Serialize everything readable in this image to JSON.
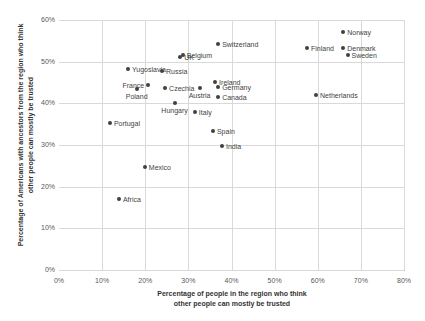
{
  "chart_data": {
    "type": "scatter",
    "title": "",
    "xlabel_line1": "Percentage of people in the region who think",
    "xlabel_line2": "other people can mostly be trusted",
    "ylabel_line1": "Percentage of Americans with ancestors from the region who think",
    "ylabel_line2": "other people can mostly be trusted",
    "xlim": [
      0,
      80
    ],
    "ylim": [
      0,
      60
    ],
    "x_ticks": [
      "0%",
      "10%",
      "20%",
      "30%",
      "40%",
      "50%",
      "60%",
      "70%",
      "80%"
    ],
    "x_tick_values": [
      0,
      10,
      20,
      30,
      40,
      50,
      60,
      70,
      80
    ],
    "y_ticks": [
      "0%",
      "10%",
      "20%",
      "30%",
      "40%",
      "50%",
      "60%"
    ],
    "y_tick_values": [
      0,
      10,
      20,
      30,
      40,
      50,
      60
    ],
    "grid": true,
    "legend": "none",
    "marker_color": "#404040",
    "grid_color": "#d9d9d9",
    "points": [
      {
        "label": "Norway",
        "x": 65.9,
        "y": 57.1,
        "pos": "right"
      },
      {
        "label": "Finland",
        "x": 57.5,
        "y": 53.2,
        "pos": "right"
      },
      {
        "label": "Denmark",
        "x": 65.9,
        "y": 53.2,
        "pos": "right"
      },
      {
        "label": "Sweden",
        "x": 66.9,
        "y": 51.6,
        "pos": "right"
      },
      {
        "label": "Switzerland",
        "x": 36.9,
        "y": 54.2,
        "pos": "right"
      },
      {
        "label": "Belgium",
        "x": 28.7,
        "y": 51.6,
        "pos": "right"
      },
      {
        "label": "UK",
        "x": 28.1,
        "y": 51.1,
        "pos": "right"
      },
      {
        "label": "Yugoslavia",
        "x": 16.0,
        "y": 48.2,
        "pos": "right"
      },
      {
        "label": "Russia",
        "x": 23.9,
        "y": 47.8,
        "pos": "right"
      },
      {
        "label": "France",
        "x": 20.7,
        "y": 44.4,
        "pos": "left"
      },
      {
        "label": "Poland",
        "x": 18.0,
        "y": 43.4,
        "pos": "below"
      },
      {
        "label": "Czechia",
        "x": 24.6,
        "y": 43.7,
        "pos": "right"
      },
      {
        "label": "Austria",
        "x": 32.6,
        "y": 43.7,
        "pos": "below"
      },
      {
        "label": "Ireland",
        "x": 36.2,
        "y": 45.1,
        "pos": "right"
      },
      {
        "label": "Germany",
        "x": 36.9,
        "y": 43.9,
        "pos": "right"
      },
      {
        "label": "Canada",
        "x": 36.9,
        "y": 41.5,
        "pos": "right"
      },
      {
        "label": "Netherlands",
        "x": 59.6,
        "y": 42.0,
        "pos": "right"
      },
      {
        "label": "Hungary",
        "x": 26.8,
        "y": 40.1,
        "pos": "below"
      },
      {
        "label": "Italy",
        "x": 31.5,
        "y": 37.9,
        "pos": "right"
      },
      {
        "label": "Portugal",
        "x": 11.8,
        "y": 35.3,
        "pos": "right"
      },
      {
        "label": "Spain",
        "x": 35.7,
        "y": 33.4,
        "pos": "right"
      },
      {
        "label": "India",
        "x": 37.8,
        "y": 29.8,
        "pos": "right"
      },
      {
        "label": "Mexico",
        "x": 19.9,
        "y": 24.7,
        "pos": "right"
      },
      {
        "label": "Africa",
        "x": 13.9,
        "y": 17.0,
        "pos": "right"
      }
    ]
  }
}
